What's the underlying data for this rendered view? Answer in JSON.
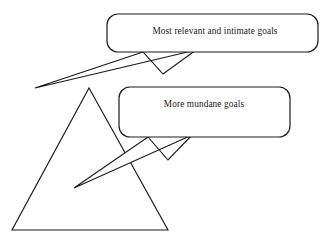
{
  "diagram": {
    "background_color": "#ffffff",
    "stroke_color": "#1a1a1a",
    "shapes": {
      "triangle": {
        "name": "goals-triangle",
        "apex": [
          89,
          88
        ],
        "bottom_left": [
          12,
          230
        ],
        "bottom_right": [
          168,
          230
        ]
      }
    },
    "callouts": [
      {
        "id": "top-callout",
        "text": "Most relevant and intimate goals",
        "box": {
          "x": 107,
          "y": 14,
          "width": 211,
          "height": 38,
          "radius": 11
        },
        "text_anchor": [
          215,
          34
        ],
        "tail_tip": [
          35,
          88
        ],
        "tail_base_left": [
          143,
          52
        ],
        "tail_base_right": [
          196,
          50
        ]
      },
      {
        "id": "bottom-callout",
        "text": "More mundane goals",
        "box": {
          "x": 119,
          "y": 87,
          "width": 171,
          "height": 50,
          "radius": 11
        },
        "text_anchor": [
          204,
          107
        ],
        "tail_tip": [
          74,
          188
        ],
        "tail_base_left": [
          148,
          137
        ],
        "tail_base_right": [
          192,
          135
        ]
      }
    ]
  }
}
